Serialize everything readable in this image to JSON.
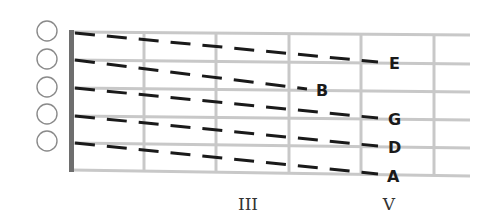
{
  "diagram": {
    "type": "guitar-fretboard-tuning",
    "colors": {
      "background": "#ffffff",
      "grid": "#c8c8c8",
      "nut": "#6e6e6e",
      "dash": "#1a1a1a",
      "circle": "#8a8a8a",
      "text": "#1a1a1a"
    },
    "open_string_circles": 5,
    "strings_count": 6,
    "frets_drawn": 5,
    "notes": [
      {
        "label": "E",
        "from_string": 1,
        "to_string": 2,
        "fret": 5
      },
      {
        "label": "B",
        "from_string": 2,
        "to_string": 3,
        "fret": 4
      },
      {
        "label": "G",
        "from_string": 3,
        "to_string": 4,
        "fret": 5
      },
      {
        "label": "D",
        "from_string": 4,
        "to_string": 5,
        "fret": 5
      },
      {
        "label": "A",
        "from_string": 5,
        "to_string": 6,
        "fret": 5
      }
    ],
    "fret_markers": [
      {
        "label": "III",
        "fret": 3
      },
      {
        "label": "V",
        "fret": 5
      }
    ]
  }
}
